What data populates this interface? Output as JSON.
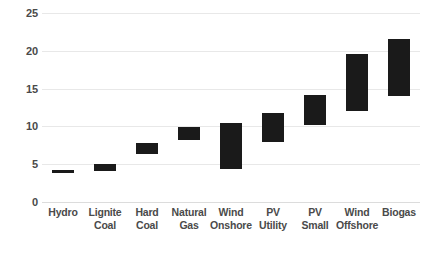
{
  "chart_data": {
    "type": "bar",
    "bar_style": "floating-range",
    "title": "",
    "subtitle": "",
    "xlabel": "",
    "ylabel": "",
    "ylim": [
      0,
      25
    ],
    "y_ticks": [
      0,
      5,
      10,
      15,
      20,
      25
    ],
    "y_tick_labels": [
      "0",
      "5",
      "10",
      "15",
      "20",
      "25"
    ],
    "grid": true,
    "legend": null,
    "legend_position": "none",
    "bar_color": "#1a1a1a",
    "grid_color": "#e8e8e8",
    "categories": [
      "Hydro",
      "Lignite Coal",
      "Hard Coal",
      "Natural Gas",
      "Wind Onshore",
      "PV Utility",
      "PV Small",
      "Wind Offshore",
      "Biogas"
    ],
    "category_lines": [
      [
        "Hydro",
        ""
      ],
      [
        "Lignite",
        "Coal"
      ],
      [
        "Hard",
        "Coal"
      ],
      [
        "Natural",
        "Gas"
      ],
      [
        "Wind",
        "Onshore"
      ],
      [
        "PV Utility",
        ""
      ],
      [
        "PV Small",
        ""
      ],
      [
        "Wind",
        "Offshore"
      ],
      [
        "Biogas",
        ""
      ]
    ],
    "series": [
      {
        "name": "range-low",
        "values": [
          3.9,
          4.1,
          6.3,
          8.2,
          4.3,
          8.0,
          10.2,
          12.0,
          14.0
        ]
      },
      {
        "name": "range-high",
        "values": [
          4.2,
          5.0,
          7.8,
          9.9,
          10.5,
          11.8,
          14.2,
          19.6,
          21.6
        ]
      }
    ],
    "bars": [
      {
        "category": "Hydro",
        "low": 3.9,
        "high": 4.2
      },
      {
        "category": "Lignite Coal",
        "low": 4.1,
        "high": 5.0
      },
      {
        "category": "Hard Coal",
        "low": 6.3,
        "high": 7.8
      },
      {
        "category": "Natural Gas",
        "low": 8.2,
        "high": 9.9
      },
      {
        "category": "Wind Onshore",
        "low": 4.3,
        "high": 10.5
      },
      {
        "category": "PV Utility",
        "low": 8.0,
        "high": 11.8
      },
      {
        "category": "PV Small",
        "low": 10.2,
        "high": 14.2
      },
      {
        "category": "Wind Offshore",
        "low": 12.0,
        "high": 19.6
      },
      {
        "category": "Biogas",
        "low": 14.0,
        "high": 21.6
      }
    ]
  }
}
